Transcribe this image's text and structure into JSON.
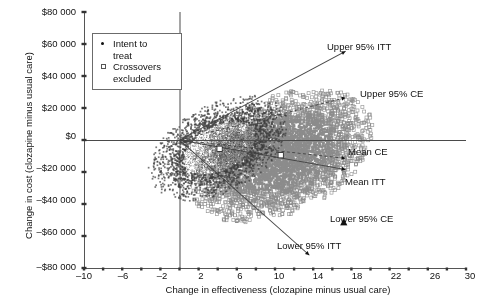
{
  "chart_data": {
    "type": "scatter",
    "title": "",
    "xlabel": "Change in effectiveness (clozapine minus usual care)",
    "ylabel": "Change in cost (clozapine minus usual care)",
    "xlim": [
      -10,
      30
    ],
    "ylim": [
      -80000,
      80000
    ],
    "xticks": [
      -10,
      -8,
      -6,
      -4,
      -2,
      0,
      2,
      4,
      6,
      8,
      10,
      12,
      14,
      16,
      18,
      20,
      22,
      24,
      26,
      28,
      30
    ],
    "xtick_labels": [
      "–10",
      "",
      "–6",
      "",
      "–2",
      "",
      "2",
      "",
      "6",
      "",
      "10",
      "",
      "14",
      "",
      "18",
      "",
      "22",
      "",
      "26",
      "",
      "30"
    ],
    "yticks": [
      -80000,
      -60000,
      -40000,
      -20000,
      0,
      20000,
      40000,
      60000,
      80000
    ],
    "ytick_labels": [
      "–$80 000",
      "–$60 000",
      "–$40 000",
      "–$20 000",
      "$0",
      "$20 000",
      "$40 000",
      "$60 000",
      "$80 000"
    ],
    "grid": false,
    "origin_lines": {
      "x": 0,
      "y": 0
    },
    "series": [
      {
        "name": "Intent to treat",
        "key": "itt",
        "marker": "dot",
        "color": "#3a3a3a",
        "n_points": 4200,
        "center_x": 4.2,
        "center_y": -5000,
        "spread_x": 3.0,
        "spread_y": 17000,
        "mean_marker_x": 4.2,
        "mean_marker_y": -5500
      },
      {
        "name": "Crossovers excluded",
        "key": "ce",
        "marker": "open-square",
        "color": "#8c8c8c",
        "n_points": 5200,
        "center_x": 10.6,
        "center_y": -9500,
        "spread_x": 4.0,
        "spread_y": 22000,
        "mean_marker_x": 10.6,
        "mean_marker_y": -9500
      }
    ],
    "rays": [
      {
        "name": "Upper 95% ITT",
        "style": "solid",
        "to_x": 17.4,
        "to_y": 55500,
        "arrow": "filled-triangle"
      },
      {
        "name": "Upper 95% CE",
        "style": "dashed",
        "to_x": 17.4,
        "to_y": 26500,
        "arrow": "filled-triangle"
      },
      {
        "name": "Mean CE",
        "style": "dashed",
        "to_x": 17.4,
        "to_y": -11500,
        "arrow": "filled-triangle"
      },
      {
        "name": "Mean ITT",
        "style": "solid",
        "to_x": 17.4,
        "to_y": -18500,
        "arrow": "filled-triangle"
      },
      {
        "name": "Lower 95% CE",
        "style": "none",
        "to_x": 17.2,
        "to_y": -51500,
        "arrow": "up-triangle"
      },
      {
        "name": "Lower 95% ITT",
        "style": "solid",
        "to_x": 13.6,
        "to_y": -72000,
        "arrow": "filled-triangle"
      }
    ]
  },
  "axes": {
    "y_label": "Change in cost (clozapine minus usual care)",
    "x_label": "Change in effectiveness (clozapine minus usual care)",
    "y_tick_labels": [
      "$80 000",
      "$60 000",
      "$40 000",
      "$20 000",
      "$0",
      "–$20 000",
      "–$40 000",
      "–$60 000",
      "–$80 000"
    ],
    "x_tick_labels": [
      "–10",
      "–6",
      "–2",
      "2",
      "6",
      "10",
      "14",
      "18",
      "22",
      "26",
      "30"
    ]
  },
  "legend": {
    "entries": [
      {
        "marker": "dot-marker",
        "label": "Intent to\ntreat"
      },
      {
        "marker": "open-square-marker",
        "label": "Crossovers\nexcluded"
      }
    ]
  },
  "annotations": [
    {
      "key": "upper95itt",
      "text": "Upper 95% ITT"
    },
    {
      "key": "upper95ce",
      "text": "Upper 95% CE"
    },
    {
      "key": "meance",
      "text": "Mean CE"
    },
    {
      "key": "meanitt",
      "text": "Mean ITT"
    },
    {
      "key": "lower95ce",
      "text": "Lower 95% CE"
    },
    {
      "key": "lower95itt",
      "text": "Lower 95% ITT"
    }
  ],
  "colors": {
    "axis": "#555555",
    "itt_points": "#3a3a3a",
    "ce_points": "#8c8c8c",
    "ray": "#444444",
    "background": "#ffffff"
  }
}
